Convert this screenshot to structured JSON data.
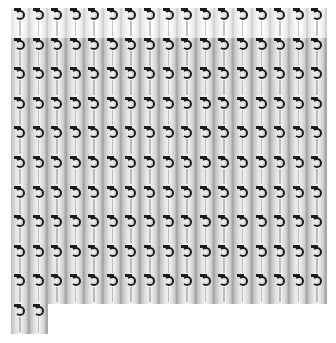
{
  "sheet": {
    "columns": 17,
    "rows": 11,
    "total_items": 172,
    "last_row_items": 2,
    "item_icon": "hanging-tag-hook-icon",
    "colors": {
      "background": "#ffffff",
      "hook": "#1c1c1c",
      "row_bar": "#2a2a2a",
      "card_light": "#f2f2f2",
      "card_mid": "#bdbdbd"
    }
  }
}
